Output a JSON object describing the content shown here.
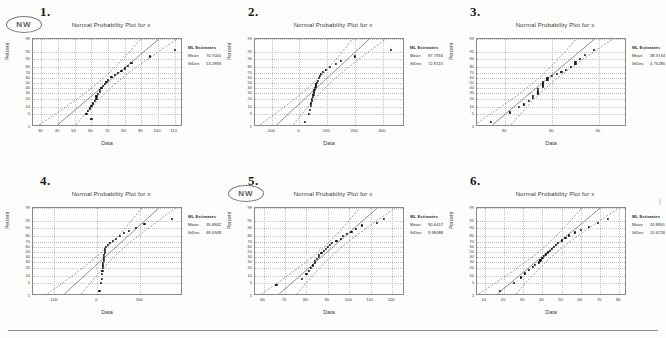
{
  "page": {
    "stamp_label": "NW",
    "bottom_rule": true
  },
  "common": {
    "title": "Normal Probability Plot for x",
    "xlabel": "Data",
    "ylabel": "Percent",
    "legend_head": "ML Estimates",
    "legend_keys": [
      "Mean",
      "StDev"
    ],
    "y_ticks": [
      "99",
      "95",
      "90",
      "80",
      "70",
      "60",
      "50",
      "40",
      "30",
      "20",
      "10",
      "5",
      "1"
    ],
    "point_color": "#111111",
    "grid_color": "#b9c2d6",
    "frame_color": "#8a8a8a"
  },
  "chart_data": [
    {
      "id": "plot-1",
      "number": "1.",
      "type": "scatter",
      "title": "Normal Probability Plot for x",
      "xlabel": "Data",
      "ylabel": "Percent",
      "has_nw_stamp": true,
      "legend": {
        "head": "ML Estimates",
        "mean": "70.7000",
        "stdev": "13.2893"
      },
      "x_ticks": [
        "30",
        "40",
        "50",
        "60",
        "70",
        "80",
        "90",
        "100",
        "110"
      ],
      "xlim": [
        25,
        115
      ],
      "ylim_percent": [
        1,
        99
      ],
      "points_x": [
        60,
        57,
        58,
        59,
        60,
        61,
        62,
        63,
        63,
        64,
        65,
        65,
        66,
        67,
        68,
        69,
        70,
        72,
        74,
        76,
        78,
        80,
        82,
        84,
        95,
        110
      ],
      "points_percent": [
        3,
        5,
        7,
        9,
        11,
        14,
        17,
        20,
        24,
        28,
        32,
        36,
        40,
        44,
        48,
        52,
        57,
        62,
        66,
        70,
        74,
        78,
        82,
        86,
        92,
        96
      ]
    },
    {
      "id": "plot-2",
      "number": "2.",
      "type": "scatter",
      "title": "Normal Probability Plot for x",
      "xlabel": "Data",
      "ylabel": "Percent",
      "has_nw_stamp": false,
      "legend": {
        "head": "ML Estimates",
        "mean": "87.7916",
        "stdev": "72.8115"
      },
      "x_ticks": [
        "-100",
        "0",
        "100",
        "200",
        "300"
      ],
      "xlim": [
        -160,
        380
      ],
      "ylim_percent": [
        1,
        99
      ],
      "points_x": [
        20,
        35,
        38,
        40,
        42,
        44,
        46,
        48,
        50,
        52,
        54,
        56,
        58,
        60,
        62,
        66,
        70,
        74,
        78,
        85,
        95,
        110,
        130,
        150,
        200,
        330
      ],
      "points_percent": [
        2,
        5,
        8,
        11,
        14,
        17,
        20,
        23,
        27,
        31,
        35,
        39,
        43,
        47,
        51,
        55,
        60,
        64,
        68,
        72,
        76,
        80,
        84,
        88,
        92,
        96
      ]
    },
    {
      "id": "plot-3",
      "number": "3.",
      "type": "scatter",
      "title": "Normal Probability Plot for x",
      "xlabel": "Data",
      "ylabel": "Percent",
      "has_nw_stamp": false,
      "legend": {
        "head": "ML Estimates",
        "mean": "38.3744",
        "stdev": "4.75280"
      },
      "x_ticks": [
        "30",
        "40",
        "50"
      ],
      "xlim": [
        24,
        56
      ],
      "ylim_percent": [
        1,
        99
      ],
      "points_x": [
        27,
        31,
        33,
        34,
        35,
        36,
        36,
        37,
        37,
        37,
        38,
        38,
        38,
        38,
        39,
        39,
        40,
        41,
        42,
        43,
        44,
        45,
        45,
        46,
        47,
        49
      ],
      "points_percent": [
        2,
        6,
        10,
        13,
        17,
        21,
        25,
        29,
        33,
        37,
        41,
        45,
        49,
        53,
        57,
        61,
        65,
        69,
        72,
        76,
        80,
        84,
        87,
        90,
        93,
        96
      ]
    },
    {
      "id": "plot-4",
      "number": "4.",
      "type": "scatter",
      "title": "Normal Probability Plot for x",
      "xlabel": "Data",
      "ylabel": "Percent",
      "has_nw_stamp": false,
      "legend": {
        "head": "ML Estimates",
        "mean": "35.8842",
        "stdev": "48.0948"
      },
      "x_ticks": [
        "-100",
        "0",
        "100"
      ],
      "xlim": [
        -150,
        200
      ],
      "ylim_percent": [
        1,
        99
      ],
      "points_x": [
        5,
        8,
        10,
        11,
        12,
        13,
        14,
        14,
        15,
        15,
        16,
        16,
        17,
        17,
        18,
        20,
        24,
        30,
        36,
        44,
        52,
        62,
        74,
        90,
        110,
        175
      ],
      "points_percent": [
        2,
        5,
        8,
        12,
        16,
        20,
        24,
        28,
        32,
        36,
        40,
        44,
        48,
        52,
        56,
        60,
        64,
        68,
        72,
        76,
        80,
        84,
        87,
        90,
        93,
        96
      ]
    },
    {
      "id": "plot-5",
      "number": "5.",
      "type": "scatter",
      "title": "Normal Probability Plot for x",
      "xlabel": "Data",
      "ylabel": "Percent",
      "has_nw_stamp": true,
      "legend": {
        "head": "ML Estimates",
        "mean": "90.6417",
        "stdev": "9.98488"
      },
      "x_ticks": [
        "60",
        "70",
        "80",
        "90",
        "100",
        "110",
        "120"
      ],
      "xlim": [
        56,
        126
      ],
      "ylim_percent": [
        1,
        99
      ],
      "points_x": [
        66,
        78,
        80,
        81,
        82,
        83,
        84,
        84,
        85,
        86,
        86,
        87,
        88,
        89,
        90,
        91,
        92,
        94,
        96,
        97,
        99,
        101,
        103,
        106,
        113,
        116
      ],
      "points_percent": [
        4,
        8,
        12,
        16,
        20,
        24,
        28,
        32,
        36,
        40,
        44,
        48,
        52,
        56,
        60,
        64,
        68,
        72,
        76,
        80,
        83,
        86,
        89,
        92,
        94,
        96
      ]
    },
    {
      "id": "plot-6",
      "number": "6.",
      "type": "scatter",
      "title": "Normal Probability Plot for x",
      "xlabel": "Data",
      "ylabel": "Percent",
      "has_nw_stamp": false,
      "legend": {
        "head": "ML Estimates",
        "mean": "43.8801",
        "stdev": "11.6728"
      },
      "x_ticks": [
        "10",
        "20",
        "30",
        "40",
        "50",
        "60",
        "70",
        "80"
      ],
      "xlim": [
        6,
        84
      ],
      "ylim_percent": [
        1,
        99
      ],
      "points_x": [
        18,
        25,
        29,
        31,
        33,
        35,
        36,
        38,
        39,
        40,
        41,
        42,
        43,
        44,
        45,
        46,
        47,
        48,
        50,
        52,
        54,
        57,
        60,
        64,
        69,
        74
      ],
      "points_percent": [
        2,
        5,
        9,
        13,
        17,
        21,
        25,
        29,
        33,
        37,
        41,
        45,
        49,
        53,
        57,
        61,
        65,
        69,
        73,
        77,
        81,
        85,
        88,
        91,
        94,
        96
      ]
    }
  ]
}
